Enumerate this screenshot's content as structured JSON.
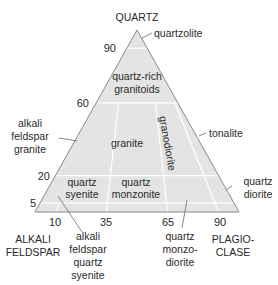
{
  "colors": {
    "fill": "#e4e4e4",
    "edge": "#8a8a8a",
    "divider": "#ffffff",
    "leader": "#6a6a6a",
    "text": "#2a2a2a"
  },
  "corners": {
    "top": "QUARTZ",
    "left_line1": "ALKALI",
    "left_line2": "FELDSPAR",
    "right_line1": "PLAGIO-",
    "right_line2": "CLASE"
  },
  "q_ticks": [
    "90",
    "60",
    "20",
    "5"
  ],
  "p_ticks": [
    "10",
    "35",
    "65",
    "90"
  ],
  "fields": {
    "quartzolite": "quartzolite",
    "quartz_rich_1": "quartz-rich",
    "quartz_rich_2": "granitoids",
    "afg_1": "alkali",
    "afg_2": "feldspar",
    "afg_3": "granite",
    "granite": "granite",
    "granodiorite": "granodiorite",
    "tonalite": "tonalite",
    "qs_1": "quartz",
    "qs_2": "syenite",
    "qm_1": "quartz",
    "qm_2": "monzonite",
    "qd_1": "quartz",
    "qd_2": "diorite",
    "afqs_1": "alkali",
    "afqs_2": "feldspar",
    "afqs_3": "quartz",
    "afqs_4": "syenite",
    "qmd_1": "quartz",
    "qmd_2": "monzo-",
    "qmd_3": "diorite"
  }
}
